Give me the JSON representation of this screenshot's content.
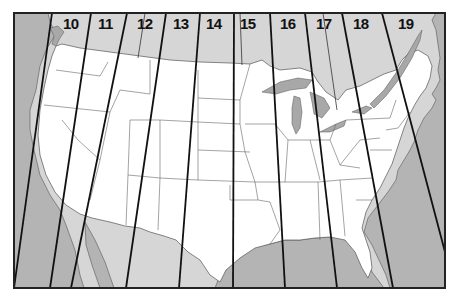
{
  "map": {
    "title": "",
    "colors": {
      "background": "#ffffff",
      "water_ocean": "#b4b4b4",
      "canada_mexico_land": "#d6d6d6",
      "us_land": "#ffffff",
      "great_lakes": "#a8a8a8",
      "state_borders": "#666666",
      "zone_lines": "#111111",
      "frame": "#222222"
    },
    "zones": [
      {
        "id": "10",
        "label": "10"
      },
      {
        "id": "11",
        "label": "11"
      },
      {
        "id": "12",
        "label": "12"
      },
      {
        "id": "13",
        "label": "13"
      },
      {
        "id": "14",
        "label": "14"
      },
      {
        "id": "15",
        "label": "15"
      },
      {
        "id": "16",
        "label": "16"
      },
      {
        "id": "17",
        "label": "17"
      },
      {
        "id": "18",
        "label": "18"
      },
      {
        "id": "19",
        "label": "19"
      }
    ]
  }
}
